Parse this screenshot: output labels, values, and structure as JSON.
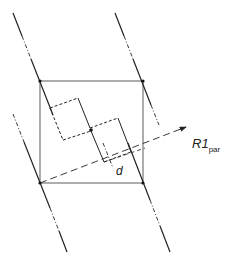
{
  "diagram": {
    "labels": {
      "distance": "d",
      "direction_main": "R1",
      "direction_sub": "par"
    },
    "colors": {
      "line": "#222222",
      "background": "#ffffff"
    }
  }
}
